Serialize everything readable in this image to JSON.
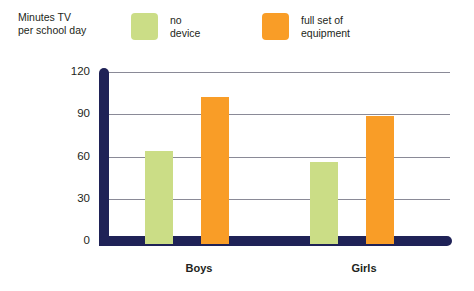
{
  "chart_data": {
    "type": "bar",
    "title": "Minutes TV\nper school day",
    "xlabel": "",
    "ylabel": "Minutes TV per school day",
    "categories": [
      "Boys",
      "Girls"
    ],
    "series": [
      {
        "name": "no device",
        "color": "#cbdd86",
        "values": [
          64,
          56
        ]
      },
      {
        "name": "full set of\nequipment",
        "color": "#f99d27",
        "values": [
          102,
          89
        ]
      }
    ],
    "ylim": [
      0,
      120
    ],
    "yticks": [
      0,
      30,
      60,
      90,
      120
    ],
    "ytick_labels": [
      "0",
      "30",
      "60",
      "90",
      "120"
    ],
    "grid": true,
    "legend_position": "top"
  },
  "legend": {
    "items": [
      {
        "label": "no device",
        "color": "#cbdd86"
      },
      {
        "label": "full set of\nequipment",
        "color": "#f99d27"
      }
    ]
  },
  "axis": {
    "title": "Minutes TV\nper school day",
    "color": "#1f2257",
    "gridline_color": "#8a8a97",
    "tick_labels": [
      "120",
      "90",
      "60",
      "30",
      "0"
    ],
    "group_labels": [
      "Boys",
      "Girls"
    ]
  }
}
